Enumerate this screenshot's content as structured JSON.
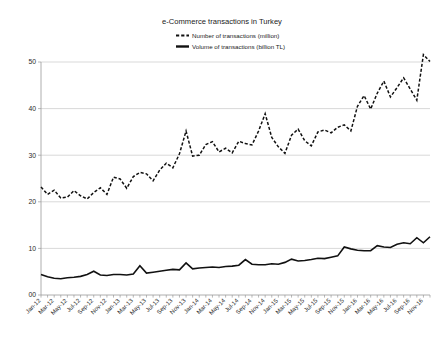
{
  "chart_data": {
    "type": "line",
    "title": "e-Commerce transactions in Turkey",
    "xlabel": "",
    "ylabel": "",
    "ylim": [
      0,
      55
    ],
    "yticks": [
      "00",
      "10",
      "20",
      "30",
      "40",
      "50"
    ],
    "ytick_values": [
      0,
      10,
      20,
      30,
      40,
      50
    ],
    "grid": true,
    "legend_position": "top-center",
    "x": [
      "Jan-12",
      "Feb-12",
      "Mar-12",
      "Apr-12",
      "May-12",
      "Jun-12",
      "Jul-12",
      "Aug-12",
      "Sep-12",
      "Oct-12",
      "Nov-12",
      "Dec-12",
      "Jan-13",
      "Feb-13",
      "Mar-13",
      "Apr-13",
      "May-13",
      "Jun-13",
      "Jul-13",
      "Aug-13",
      "Sep-13",
      "Oct-13",
      "Nov-13",
      "Dec-13",
      "Jan-14",
      "Feb-14",
      "Mar-14",
      "Apr-14",
      "May-14",
      "Jun-14",
      "Jul-14",
      "Aug-14",
      "Sep-14",
      "Oct-14",
      "Nov-14",
      "Dec-14",
      "Jan-15",
      "Feb-15",
      "Mar-15",
      "Apr-15",
      "May-15",
      "Jun-15",
      "Jul-15",
      "Aug-15",
      "Sep-15",
      "Oct-15",
      "Nov-15",
      "Dec-15",
      "Jan-16",
      "Feb-16",
      "Mar-16",
      "Apr-16",
      "May-16",
      "Jun-16",
      "Jul-16",
      "Aug-16",
      "Sep-16",
      "Oct-16",
      "Nov-16",
      "Dec-16"
    ],
    "xtick_labels": [
      "Jan-12",
      "Mar-12",
      "May-12",
      "Jul-12",
      "Sep-12",
      "Nov-12",
      "Jan-13",
      "Mar-13",
      "May-13",
      "Jul-13",
      "Sep-13",
      "Nov-13",
      "Jan-14",
      "Mar-14",
      "May-14",
      "Jul-14",
      "Sep-14",
      "Nov-14",
      "Jan-15",
      "Mar-15",
      "May-15",
      "Jul-15",
      "Sep-15",
      "Nov-15",
      "Jan-16",
      "Mar-16",
      "May-16",
      "Jul-16",
      "Sep-16",
      "Nov-16"
    ],
    "xtick_step": 2,
    "series": [
      {
        "name": "Number of transactions (million)",
        "style": "dashed",
        "color": "#111111",
        "values": [
          23.2,
          21.6,
          22.5,
          20.8,
          21.0,
          22.4,
          21.3,
          20.6,
          22.0,
          23.0,
          21.6,
          25.3,
          24.9,
          22.9,
          25.4,
          26.3,
          26.0,
          24.5,
          26.8,
          28.3,
          27.3,
          30.3,
          35.2,
          29.8,
          30.0,
          32.3,
          32.9,
          30.7,
          31.5,
          30.5,
          33.0,
          32.5,
          32.2,
          35.2,
          38.9,
          33.8,
          31.8,
          30.4,
          34.3,
          35.6,
          33.1,
          32.0,
          35.0,
          35.4,
          34.8,
          36.0,
          36.5,
          35.2,
          40.5,
          42.8,
          39.9,
          43.3,
          45.9,
          42.5,
          44.5,
          46.6,
          44.2,
          41.8,
          51.6,
          50.1
        ]
      },
      {
        "name": "Volume of transactions (billion TL)",
        "style": "solid",
        "color": "#111111",
        "values": [
          4.4,
          3.9,
          3.6,
          3.5,
          3.7,
          3.8,
          4.0,
          4.4,
          5.1,
          4.3,
          4.2,
          4.4,
          4.4,
          4.3,
          4.5,
          6.3,
          4.7,
          4.9,
          5.1,
          5.3,
          5.5,
          5.4,
          6.9,
          5.6,
          5.8,
          5.9,
          6.0,
          5.9,
          6.1,
          6.2,
          6.4,
          7.6,
          6.6,
          6.5,
          6.5,
          6.7,
          6.6,
          7.0,
          7.7,
          7.3,
          7.4,
          7.6,
          7.9,
          7.8,
          8.1,
          8.4,
          10.3,
          9.9,
          9.6,
          9.5,
          9.5,
          10.6,
          10.3,
          10.2,
          10.9,
          11.2,
          11.0,
          12.3,
          11.2,
          12.5
        ]
      }
    ]
  },
  "legend": {
    "entries": [
      {
        "label": "Number of transactions (million)",
        "marker": "dashed-line-icon"
      },
      {
        "label": "Volume of transactions (billion TL)",
        "marker": "solid-line-icon"
      }
    ]
  }
}
